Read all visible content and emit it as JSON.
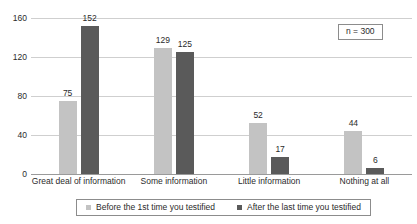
{
  "chart_data": {
    "type": "bar",
    "title": "",
    "subtitle": "",
    "xlabel": "",
    "ylabel": "",
    "categories": [
      "Great deal of information",
      "Some information",
      "Little information",
      "Nothing at all"
    ],
    "series": [
      {
        "name": "Before the 1st time you testified",
        "color": "#c3c3c3",
        "values": [
          75,
          129,
          52,
          44
        ]
      },
      {
        "name": "After the last time you testified",
        "color": "#5a5a5a",
        "values": [
          152,
          125,
          17,
          6
        ]
      }
    ],
    "ylim": [
      0,
      160
    ],
    "yticks": [
      0,
      40,
      80,
      120,
      160
    ],
    "ytick_labels": [
      "0",
      "40",
      "80",
      "120",
      "160"
    ],
    "grid": "horizontal",
    "data_labels": true,
    "legend_position": "bottom",
    "annotations": [
      {
        "text": "n = 300",
        "position": "top-right",
        "boxed": true
      }
    ]
  },
  "axis": {
    "y_tick_labels": [
      "160",
      "120",
      "80",
      "40",
      "0"
    ]
  },
  "annotation": {
    "sample_size_label": "n = 300"
  },
  "legend": {
    "items": [
      {
        "label": "Before the 1st time you testified"
      },
      {
        "label": "After the last time you testified"
      }
    ]
  }
}
